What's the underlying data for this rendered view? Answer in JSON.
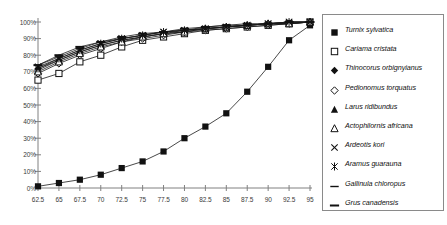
{
  "chart_data": {
    "type": "line",
    "title": "",
    "xlabel": "",
    "ylabel": "",
    "xlim": [
      62.5,
      95
    ],
    "ylim": [
      0,
      100
    ],
    "grid": false,
    "legend_position": "right",
    "x": [
      62.5,
      65,
      67.5,
      70,
      72.5,
      75,
      77.5,
      80,
      82.5,
      85,
      87.5,
      90,
      92.5,
      95
    ],
    "x_tick_labels": [
      "62.5",
      "65",
      "67.5",
      "70",
      "72.5",
      "75",
      "77.5",
      "80",
      "82.5",
      "85",
      "87.5",
      "90",
      "92.5",
      "95"
    ],
    "y_tick_labels": [
      "0%",
      "10%",
      "20%",
      "30%",
      "40%",
      "50%",
      "60%",
      "70%",
      "80%",
      "90%",
      "100%"
    ],
    "y_tick_values": [
      0,
      10,
      20,
      30,
      40,
      50,
      60,
      70,
      80,
      90,
      100
    ],
    "series": [
      {
        "name": "Turnix sylvatica",
        "marker": "filled-square",
        "values": [
          1,
          3,
          5,
          8,
          12,
          16,
          22,
          30,
          37,
          45,
          58,
          73,
          89,
          98
        ]
      },
      {
        "name": "Cariama cristata",
        "marker": "open-square",
        "values": [
          65,
          69,
          76,
          80,
          85,
          89,
          91,
          93,
          95,
          96,
          97,
          98,
          99,
          100
        ]
      },
      {
        "name": "Thinocorus orbignyianus",
        "marker": "filled-diamond",
        "values": [
          72,
          77,
          82,
          86,
          89,
          91,
          93,
          94,
          96,
          97,
          98,
          99,
          99,
          100
        ]
      },
      {
        "name": "Pedionomus torquatus",
        "marker": "open-diamond",
        "values": [
          69,
          75,
          80,
          84,
          88,
          90,
          92,
          94,
          95,
          96,
          97,
          98,
          99,
          100
        ]
      },
      {
        "name": "Larus ridibundus",
        "marker": "filled-triangle",
        "values": [
          71,
          77,
          82,
          86,
          89,
          91,
          93,
          95,
          96,
          97,
          98,
          99,
          99,
          100
        ]
      },
      {
        "name": "Actophilornis africana",
        "marker": "open-triangle",
        "values": [
          70,
          76,
          81,
          85,
          88,
          91,
          93,
          94,
          96,
          97,
          98,
          99,
          99,
          100
        ]
      },
      {
        "name": "Ardeotis kori",
        "marker": "cross-x",
        "values": [
          73,
          78,
          83,
          87,
          90,
          92,
          94,
          95,
          96,
          97,
          98,
          99,
          100,
          100
        ]
      },
      {
        "name": "Aramus guarauna",
        "marker": "asterisk",
        "values": [
          72,
          78,
          83,
          87,
          90,
          92,
          94,
          95,
          96,
          97,
          98,
          99,
          100,
          100
        ]
      },
      {
        "name": "Gallinula chloropus",
        "marker": "dash-arrow",
        "values": [
          74,
          79,
          84,
          88,
          90,
          92,
          94,
          95,
          97,
          98,
          98,
          99,
          100,
          100
        ]
      },
      {
        "name": "Grus canadensis",
        "marker": "thick-dash",
        "values": [
          74,
          80,
          85,
          88,
          91,
          93,
          94,
          96,
          97,
          98,
          99,
          99,
          100,
          100
        ]
      }
    ]
  },
  "colors": {
    "axis": "#808080",
    "series_line": "#1a1a1a",
    "legend_border": "#8a8a8a",
    "background": "#ffffff",
    "tick_text": "#3a3a3a"
  }
}
